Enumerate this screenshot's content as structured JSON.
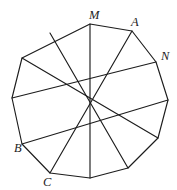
{
  "figure": {
    "type": "geometry-diagram",
    "shape": "regular-hendecagon-with-star-chords",
    "stroke_color": "#1c1c1c",
    "background_color": "#ffffff",
    "vertex_count": 11,
    "chord_count": 6,
    "labels": [
      {
        "id": "M",
        "text": "M",
        "x": 89,
        "y": 19,
        "vertex_x": 90,
        "vertex_y": 24
      },
      {
        "id": "A",
        "text": "A",
        "x": 131,
        "y": 26,
        "vertex_x": 132,
        "vertex_y": 31
      },
      {
        "id": "N",
        "text": "N",
        "x": 161,
        "y": 60,
        "vertex_x": 156,
        "vertex_y": 62
      },
      {
        "id": "B",
        "text": "B",
        "x": 14,
        "y": 152,
        "vertex_x": 22,
        "vertex_y": 144
      },
      {
        "id": "C",
        "text": "C",
        "x": 43,
        "y": 186,
        "vertex_x": 50,
        "vertex_y": 173
      }
    ],
    "polygon_points": "90,24 132,31 156,62 168,100 158,138 128,168 90,178 50,173 22,144 12,98 22,58",
    "chords": [
      {
        "id": "chord-M-bottom",
        "x1": 90,
        "y1": 24,
        "x2": 90,
        "y2": 178
      },
      {
        "id": "chord-A-C",
        "x1": 132,
        "y1": 31,
        "x2": 50,
        "y2": 173
      },
      {
        "id": "chord-N-left",
        "x1": 156,
        "y1": 62,
        "x2": 12,
        "y2": 98
      },
      {
        "id": "chord-upperleft-right",
        "x1": 22,
        "y1": 58,
        "x2": 158,
        "y2": 138
      },
      {
        "id": "chord-B-right",
        "x1": 22,
        "y1": 144,
        "x2": 168,
        "y2": 100
      },
      {
        "id": "chord-topleft-bottomright",
        "x1": 50,
        "y1": 33,
        "x2": 128,
        "y2": 168
      }
    ]
  }
}
